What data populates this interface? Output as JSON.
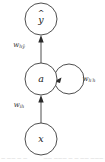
{
  "figure": {
    "type": "recurrent-neural-network-unit-diagram",
    "background_color": "#ffffff",
    "stroke_color": "#3a3a3a",
    "text_color": "#222222"
  },
  "nodes": [
    {
      "id": "output",
      "label": "y",
      "accent": "^",
      "has_hat": true,
      "role": "predicted-output",
      "cx": 41,
      "cy": 19,
      "r": 16
    },
    {
      "id": "hidden",
      "label": "a",
      "accent": "",
      "has_hat": false,
      "role": "hidden-activation",
      "cx": 41,
      "cy": 79,
      "r": 16
    },
    {
      "id": "input",
      "label": "x",
      "accent": "",
      "has_hat": false,
      "role": "input",
      "cx": 41,
      "cy": 139,
      "r": 16
    }
  ],
  "edges": [
    {
      "id": "hidden-to-output",
      "from": "hidden",
      "to": "output",
      "direction": "up",
      "weight_base": "w",
      "weight_sub": "hŷ",
      "label_x": 19,
      "label_y": 45
    },
    {
      "id": "input-to-hidden",
      "from": "input",
      "to": "hidden",
      "direction": "up",
      "weight_base": "w",
      "weight_sub": "ih",
      "label_x": 19,
      "label_y": 105
    },
    {
      "id": "hidden-self-loop",
      "from": "hidden",
      "to": "hidden",
      "direction": "recurrent",
      "weight_base": "w",
      "weight_sub": "h′h",
      "label_x": 88,
      "label_y": 79,
      "loop_cx": 69,
      "loop_cy": 79,
      "loop_r": 15
    }
  ],
  "caption": {
    "visible": "partially-cut-off",
    "left_fragment": "—  ——  — —",
    "right_fragment": "—— ——— — —  —— ——— —"
  }
}
